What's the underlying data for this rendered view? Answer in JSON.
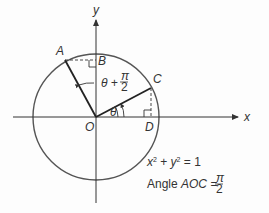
{
  "diagram": {
    "axes": {
      "x_label": "x",
      "y_label": "y",
      "origin_label": "O"
    },
    "points": {
      "A": "A",
      "B": "B",
      "C": "C",
      "D": "D"
    },
    "angles": {
      "theta": "θ",
      "theta_plus_prefix": "θ + ",
      "pi": "π",
      "two": "2"
    },
    "equations": {
      "circle": {
        "x": "x",
        "plus": " + ",
        "y": "y",
        "eq": " = 1",
        "exp": "2"
      },
      "angle_prefix": "Angle ",
      "angle_name": "AOC",
      "angle_eq": " = ",
      "angle_num": "π",
      "angle_den": "2"
    },
    "colors": {
      "stroke": "#333333",
      "circle": "#555555"
    }
  }
}
